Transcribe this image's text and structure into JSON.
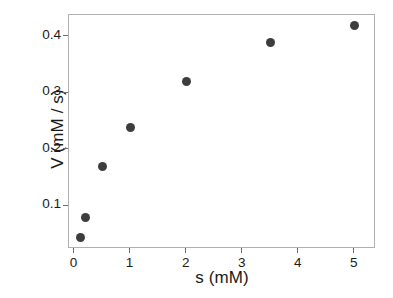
{
  "chart_data": {
    "type": "scatter",
    "title": "",
    "xlabel": "s (mM)",
    "ylabel": "V (mM / s)",
    "x": [
      0.1,
      0.2,
      0.5,
      1.0,
      2.0,
      3.5,
      5.0
    ],
    "values": [
      0.045,
      0.08,
      0.17,
      0.24,
      0.32,
      0.39,
      0.42
    ],
    "series": [
      {
        "name": "V",
        "x": [
          0.1,
          0.2,
          0.5,
          1.0,
          2.0,
          3.5,
          5.0
        ],
        "values": [
          0.045,
          0.08,
          0.17,
          0.24,
          0.32,
          0.39,
          0.42
        ]
      }
    ],
    "xlim": [
      -0.1,
      5.38
    ],
    "ylim": [
      0.0245,
      0.4385
    ],
    "xticks": [
      0,
      1,
      2,
      3,
      4,
      5
    ],
    "xticklabels": [
      "0",
      "1",
      "2",
      "3",
      "4",
      "5"
    ],
    "yticks": [
      0.1,
      0.2,
      0.3,
      0.4
    ],
    "yticklabels": [
      "0.1",
      "0.2",
      "0.3",
      "0.4"
    ],
    "grid": false,
    "legend": false,
    "marker": "circle",
    "marker_color": "#3d3d3d",
    "marker_size": 9,
    "panel_border_color": "#b0b0b0",
    "background_color": "#ffffff",
    "text_color": "#1a1a1a"
  }
}
